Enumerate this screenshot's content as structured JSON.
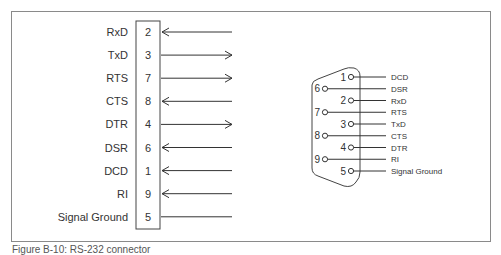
{
  "left_diagram": {
    "rows": [
      {
        "signal": "RxD",
        "pin": "2",
        "direction": "in"
      },
      {
        "signal": "TxD",
        "pin": "3",
        "direction": "out"
      },
      {
        "signal": "RTS",
        "pin": "7",
        "direction": "out"
      },
      {
        "signal": "CTS",
        "pin": "8",
        "direction": "in"
      },
      {
        "signal": "DTR",
        "pin": "4",
        "direction": "out"
      },
      {
        "signal": "DSR",
        "pin": "6",
        "direction": "in"
      },
      {
        "signal": "DCD",
        "pin": "1",
        "direction": "in"
      },
      {
        "signal": "RI",
        "pin": "9",
        "direction": "in"
      },
      {
        "signal": "Signal Ground",
        "pin": "5",
        "direction": "none"
      }
    ]
  },
  "right_diagram": {
    "connector": "DB9",
    "pins": [
      {
        "pin": "1",
        "signal": "DCD"
      },
      {
        "pin": "6",
        "signal": "DSR"
      },
      {
        "pin": "2",
        "signal": "RxD"
      },
      {
        "pin": "7",
        "signal": "RTS"
      },
      {
        "pin": "3",
        "signal": "TxD"
      },
      {
        "pin": "8",
        "signal": "CTS"
      },
      {
        "pin": "4",
        "signal": "DTR"
      },
      {
        "pin": "9",
        "signal": "RI"
      },
      {
        "pin": "5",
        "signal": "Signal Ground"
      }
    ]
  },
  "caption": "Figure B-10: RS-232 connector"
}
